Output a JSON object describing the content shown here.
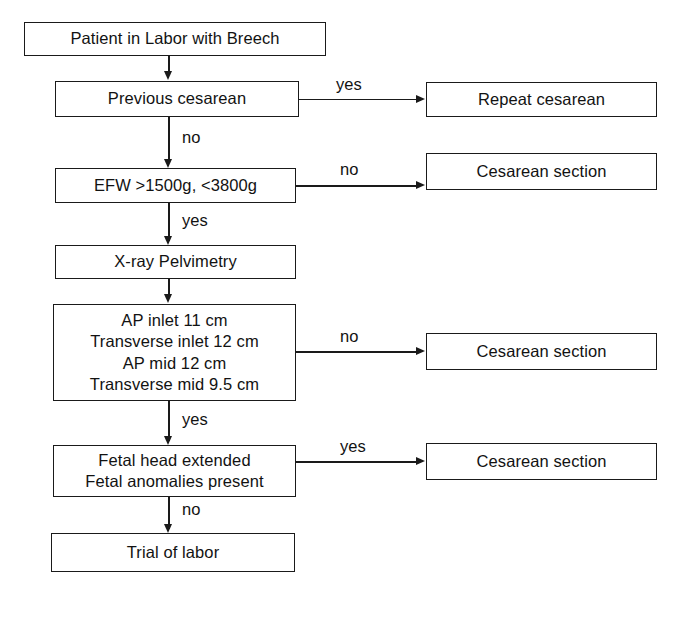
{
  "diagram": {
    "type": "flowchart",
    "background_color": "#ffffff",
    "line_color": "#1a1a1a",
    "text_color": "#121212"
  },
  "nodes": {
    "start": {
      "text": "Patient in Labor with Breech"
    },
    "previous_cesarean": {
      "text": "Previous cesarean"
    },
    "repeat_cesarean": {
      "text": "Repeat cesarean"
    },
    "efw": {
      "text": "EFW >1500g, <3800g"
    },
    "cesarean_section_efw": {
      "text": "Cesarean section"
    },
    "pelvimetry": {
      "text": "X-ray Pelvimetry"
    },
    "pelvimetry_criteria": {
      "line1": "AP inlet 11 cm",
      "line2": "Transverse inlet 12 cm",
      "line3": "AP mid 12 cm",
      "line4": "Transverse mid 9.5 cm"
    },
    "cesarean_section_pelvimetry": {
      "text": "Cesarean section"
    },
    "fetal_findings": {
      "line1": "Fetal head extended",
      "line2": "Fetal anomalies present"
    },
    "cesarean_section_fetal": {
      "text": "Cesarean section"
    },
    "trial_of_labor": {
      "text": "Trial of labor"
    }
  },
  "edge_labels": {
    "previous_cesarean_yes": "yes",
    "previous_cesarean_no": "no",
    "efw_no": "no",
    "efw_yes": "yes",
    "pelvimetry_no": "no",
    "pelvimetry_yes": "yes",
    "fetal_yes": "yes",
    "fetal_no": "no"
  }
}
